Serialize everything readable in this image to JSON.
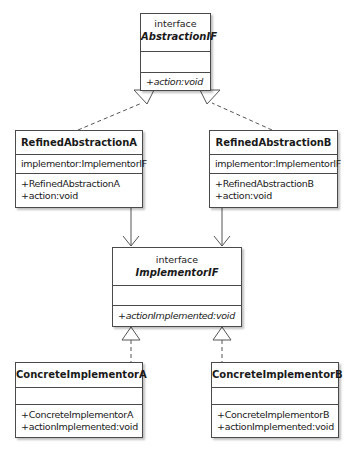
{
  "diagram": {
    "type": "UML class diagram",
    "classes": {
      "abstraction_if": {
        "stereotype": "interface",
        "name": "AbstractionIF",
        "attributes": [],
        "operations": [
          "+action:void"
        ]
      },
      "refined_a": {
        "name": "RefinedAbstractionA",
        "attributes": [
          "implementor:ImplementorIF"
        ],
        "operations": [
          "+RefinedAbstractionA",
          "+action:void"
        ]
      },
      "refined_b": {
        "name": "RefinedAbstractionB",
        "attributes": [
          "implementor:ImplementorIF"
        ],
        "operations": [
          "+RefinedAbstractionB",
          "+action:void"
        ]
      },
      "implementor_if": {
        "stereotype": "interface",
        "name": "ImplementorIF",
        "attributes": [],
        "operations": [
          "+actionImplemented:void"
        ]
      },
      "concrete_a": {
        "name": "ConcreteImplementorA",
        "attributes": [],
        "operations": [
          "+ConcreteImplementorA",
          "+actionImplemented:void"
        ]
      },
      "concrete_b": {
        "name": "ConcreteImplementorB",
        "attributes": [],
        "operations": [
          "+ConcreteImplementorB",
          "+actionImplemented:void"
        ]
      }
    },
    "relationships": [
      {
        "from": "RefinedAbstractionA",
        "to": "AbstractionIF",
        "kind": "realization"
      },
      {
        "from": "RefinedAbstractionB",
        "to": "AbstractionIF",
        "kind": "realization"
      },
      {
        "from": "RefinedAbstractionA",
        "to": "ImplementorIF",
        "kind": "association"
      },
      {
        "from": "RefinedAbstractionB",
        "to": "ImplementorIF",
        "kind": "association"
      },
      {
        "from": "ConcreteImplementorA",
        "to": "ImplementorIF",
        "kind": "realization"
      },
      {
        "from": "ConcreteImplementorB",
        "to": "ImplementorIF",
        "kind": "realization"
      }
    ]
  }
}
